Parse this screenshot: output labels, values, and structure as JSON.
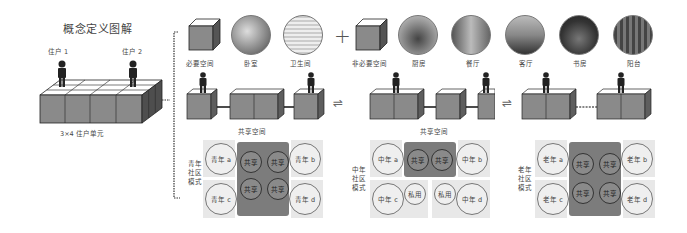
{
  "title": "概念定义图解",
  "left_block": {
    "resident_1": "住户 1",
    "resident_2": "住户 2",
    "caption": "3×4 住户单元"
  },
  "top_row": {
    "necessary": {
      "label": "必要空间",
      "rooms": [
        "卧室",
        "卫生间"
      ]
    },
    "plus": "+",
    "optional": {
      "label": "非必要空间",
      "rooms": [
        "厨房",
        "餐厅",
        "客厅",
        "书房",
        "阳台"
      ]
    }
  },
  "middle_row": {
    "shared_label_1": "共享空间",
    "shared_label_2": "共享空间",
    "swap_symbol": "⇌"
  },
  "modes": [
    {
      "label": [
        "青年",
        "社区",
        "模式"
      ],
      "corners": [
        "青年 a",
        "青年 b",
        "青年 c",
        "青年 d"
      ],
      "center": [
        "共享",
        "共享",
        "共享",
        "共享"
      ]
    },
    {
      "label": [
        "中年",
        "社区",
        "模式"
      ],
      "corners": [
        "中年 a",
        "中年 b",
        "中年 c",
        "中年 d"
      ],
      "center": [
        "共享",
        "共享"
      ],
      "private": [
        "私用",
        "私用"
      ]
    },
    {
      "label": [
        "老年",
        "社区",
        "模式"
      ],
      "corners": [
        "老年 a",
        "老年 b",
        "老年 c",
        "老年 d"
      ],
      "center": [
        "共享",
        "共享",
        "共享",
        "共享"
      ]
    }
  ],
  "colors": {
    "cube_front": "#8a8a8a",
    "cube_side": "#5e5e5e",
    "cube_top": "#ffffff",
    "panel_dark": "#7c7c7c",
    "panel_light": "#e8e8e8"
  }
}
